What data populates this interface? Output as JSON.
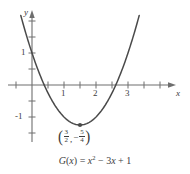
{
  "figure": {
    "caption_function_name": "G",
    "caption_text": "G(x) = x² − 3x + 1",
    "background_color": "#ffffff",
    "curve_color": "#4a4a4a",
    "axis_color": "#6e6e6e",
    "text_color": "#3b3b3b"
  },
  "axes": {
    "x_axis_label": "x",
    "y_axis_label": "y",
    "x_tick_labels": [
      "1",
      "2",
      "3"
    ],
    "y_tick_labels": [
      "1",
      "-1"
    ],
    "x_minor_tick_step": 0.5,
    "y_minor_tick_step": 0.5,
    "x_range": [
      -0.45,
      4.4
    ],
    "y_range": [
      -2.05,
      2.1
    ],
    "origin_px": [
      32,
      85
    ],
    "unit_px": 32,
    "grid": false
  },
  "vertex": {
    "x_numerator": "3",
    "x_denominator": "2",
    "y_sign": "−",
    "y_numerator": "5",
    "y_denominator": "4",
    "comma": ",",
    "open_paren": "(",
    "close_paren": ")",
    "x_value": 1.5,
    "y_value": -1.25,
    "marker": "dot"
  },
  "caption_parts": {
    "fn": "G",
    "open": "(",
    "arg": "x",
    "close": ")",
    "equals": "=",
    "term1_var": "x",
    "term1_exp": "2",
    "minus": "−",
    "term2": "3",
    "term2_var": "x",
    "plus": "+",
    "term3": "1"
  },
  "chart_data": {
    "type": "line",
    "title": "",
    "subtitle": "",
    "xlabel": "x",
    "ylabel": "y",
    "function": "G(x) = x^2 - 3x + 1",
    "coefficients": {
      "a": 1,
      "b": -3,
      "c": 1
    },
    "xlim": [
      -0.45,
      4.4
    ],
    "ylim": [
      -2.05,
      2.1
    ],
    "xticks": [
      1,
      2,
      3
    ],
    "yticks": [
      1,
      -1
    ],
    "minor_tick_step": 0.5,
    "grid": false,
    "legend": null,
    "annotations": [
      {
        "label": "(3/2, -5/4)",
        "x": 1.5,
        "y": -1.25,
        "type": "vertex-point"
      }
    ],
    "roots": [
      0.381966,
      2.618034
    ],
    "y_intercept": 1,
    "vertex": [
      1.5,
      -1.25
    ],
    "x": [
      -0.35,
      -0.2,
      0.0,
      0.25,
      0.5,
      0.75,
      1.0,
      1.25,
      1.5,
      1.75,
      2.0,
      2.25,
      2.5,
      2.75,
      3.0,
      3.25,
      3.5
    ],
    "y": [
      2.17,
      1.64,
      1.0,
      0.31,
      -0.25,
      -0.69,
      -1.0,
      -1.19,
      -1.25,
      -1.19,
      -1.0,
      -0.69,
      -0.25,
      0.31,
      1.0,
      1.81,
      2.75
    ]
  }
}
